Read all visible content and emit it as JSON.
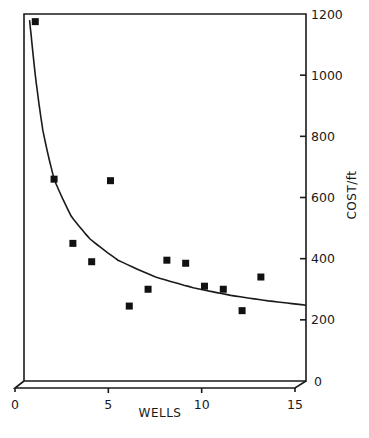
{
  "chart_data": {
    "type": "scatter",
    "title": "",
    "xlabel": "WELLS",
    "ylabel": "COST/ft",
    "xlim": [
      0,
      15
    ],
    "ylim": [
      0,
      1200
    ],
    "x_ticks": [
      0,
      5,
      10,
      15
    ],
    "x_tick_labels": [
      "0",
      "5",
      "10",
      "15"
    ],
    "y_ticks": [
      0,
      200,
      400,
      600,
      800,
      1000,
      1200
    ],
    "y_tick_labels": [
      "0",
      "200",
      "400",
      "600",
      "800",
      "1000",
      "1200"
    ],
    "grid": false,
    "legend": null,
    "style": "3D box frame, y-axis on right side",
    "series": [
      {
        "name": "observed",
        "marker": "filled-square",
        "x": [
          0.6,
          1.6,
          2.6,
          3.6,
          4.6,
          5.6,
          6.6,
          7.6,
          8.6,
          9.6,
          10.6,
          11.6,
          12.6
        ],
        "y": [
          1175,
          660,
          450,
          390,
          655,
          245,
          300,
          395,
          385,
          310,
          300,
          230,
          340
        ]
      },
      {
        "name": "fitted-curve",
        "marker": "line",
        "x": [
          0.3,
          0.6,
          1.0,
          1.6,
          2.5,
          3.5,
          5.0,
          7.0,
          9.0,
          11.0,
          13.0,
          15.0
        ],
        "y": [
          1180,
          1000,
          820,
          660,
          540,
          465,
          395,
          340,
          305,
          280,
          262,
          248
        ]
      }
    ]
  }
}
